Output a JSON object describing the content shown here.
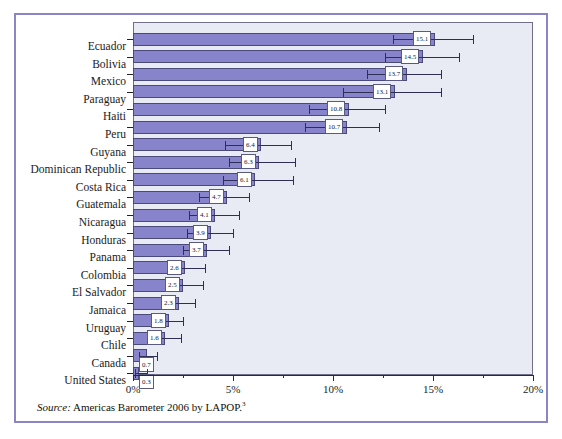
{
  "figure": {
    "source_prefix": "Source:",
    "source_text": " Americas Barometer 2006 by LAPOP.",
    "source_footnote": "3",
    "frame_color": "#8a86c4",
    "bar_color": "#8884cc",
    "bar_border_color": "#4a4a7a",
    "plot_background": "#e8eaf4",
    "error_bar_color": "#2f2f55"
  },
  "chart_data": {
    "type": "bar",
    "orientation": "horizontal",
    "title": "",
    "xlabel": "",
    "ylabel": "",
    "xlim": [
      0,
      20
    ],
    "xunit": "%",
    "grid": false,
    "legend": "none",
    "xticks": [
      "0%",
      "5%",
      "10%",
      "15%",
      "20%"
    ],
    "xtick_values": [
      0,
      5,
      10,
      15,
      20
    ],
    "xminor_tick_values": [
      2.5,
      7.5,
      12.5,
      17.5
    ],
    "categories": [
      "Ecuador",
      "Bolivia",
      "Mexico",
      "Paraguay",
      "Haiti",
      "Peru",
      "Guyana",
      "Dominican Republic",
      "Costa Rica",
      "Guatemala",
      "Nicaragua",
      "Honduras",
      "Panama",
      "Colombia",
      "El Salvador",
      "Jamaica",
      "Uruguay",
      "Chile",
      "Canada",
      "United States"
    ],
    "values": [
      15.1,
      14.5,
      13.7,
      13.1,
      10.8,
      10.7,
      6.4,
      6.3,
      6.1,
      4.7,
      4.1,
      3.9,
      3.7,
      2.6,
      2.5,
      2.3,
      1.8,
      1.6,
      0.7,
      0.3
    ],
    "value_labels": [
      "15.1",
      "14.5",
      "13.7",
      "13.1",
      "10.8",
      "10.7",
      "6.4",
      "6.3",
      "6.1",
      "4.7",
      "4.1",
      "3.9",
      "3.7",
      "2.6",
      "2.5",
      "2.3",
      "1.8",
      "1.6",
      "0.7",
      "0.3"
    ],
    "error_low": [
      13.0,
      12.6,
      11.7,
      10.5,
      8.8,
      8.6,
      4.6,
      4.8,
      4.5,
      3.3,
      2.8,
      2.7,
      2.5,
      1.7,
      1.6,
      1.5,
      1.1,
      0.9,
      0.3,
      0.1
    ],
    "error_high": [
      17.0,
      16.3,
      15.4,
      15.4,
      12.6,
      12.3,
      7.9,
      8.1,
      8.0,
      5.8,
      5.3,
      5.0,
      4.8,
      3.6,
      3.5,
      3.1,
      2.5,
      2.4,
      1.2,
      0.7
    ]
  }
}
